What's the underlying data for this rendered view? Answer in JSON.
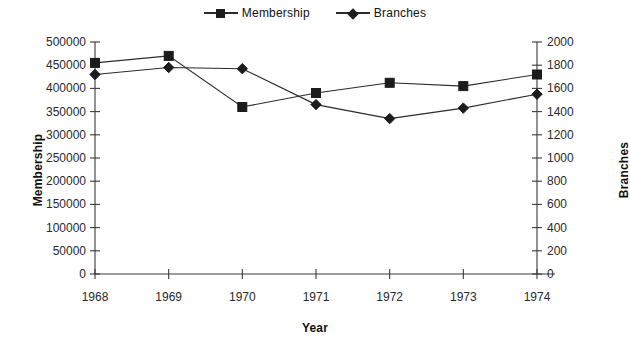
{
  "chart_data": {
    "type": "line",
    "title": "",
    "xlabel": "Year",
    "ylabel": "Membership",
    "y2label": "Branches",
    "categories": [
      "1968",
      "1969",
      "1970",
      "1971",
      "1972",
      "1973",
      "1974"
    ],
    "ylim": [
      0,
      500000
    ],
    "y2lim": [
      0,
      2000
    ],
    "ytick_step": 50000,
    "y2tick_step": 200,
    "yticks": [
      "0",
      "50000",
      "100000",
      "150000",
      "200000",
      "250000",
      "300000",
      "350000",
      "400000",
      "450000",
      "500000"
    ],
    "y2ticks": [
      "0",
      "200",
      "400",
      "600",
      "800",
      "1000",
      "1200",
      "1400",
      "1600",
      "1800",
      "2000"
    ],
    "grid": false,
    "legend_position": "top-center",
    "series": [
      {
        "name": "Membership",
        "axis": "left",
        "marker": "square",
        "color": "#1c1c1c",
        "values": [
          455000,
          470000,
          360000,
          390000,
          412000,
          405000,
          430000
        ]
      },
      {
        "name": "Branches",
        "axis": "right",
        "marker": "diamond",
        "color": "#1c1c1c",
        "values": [
          1720,
          1780,
          1770,
          1460,
          1340,
          1430,
          1550
        ]
      }
    ]
  },
  "legend": {
    "entries": [
      {
        "label": "Membership",
        "marker": "square"
      },
      {
        "label": "Branches",
        "marker": "diamond"
      }
    ]
  },
  "axes": {
    "x_title": "Year",
    "y_left_title": "Membership",
    "y_right_title": "Branches"
  }
}
